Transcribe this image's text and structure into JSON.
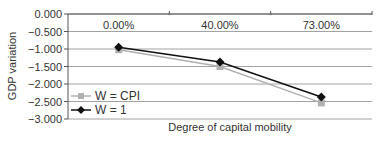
{
  "chart_data": {
    "type": "line",
    "title": "",
    "xlabel": "Degree of capital mobility",
    "ylabel": "GDP variation",
    "categories": [
      "0.00%",
      "40.00%",
      "73.00%"
    ],
    "series": [
      {
        "name": "W = CPI",
        "values": [
          -1.02,
          -1.5,
          -2.54
        ],
        "color": "#b0b0b0",
        "marker": "square"
      },
      {
        "name": "W = 1",
        "values": [
          -0.95,
          -1.37,
          -2.37
        ],
        "color": "#111111",
        "marker": "diamond"
      }
    ],
    "ylim": [
      -3.0,
      0.0
    ],
    "yticks": [
      "0.000",
      "-0.500",
      "-1.000",
      "-1.500",
      "-2.000",
      "-2.500",
      "-3.000"
    ],
    "grid": true,
    "legend_position": "lower-left inside",
    "category_labels_position": "top, below x-axis at y=0"
  }
}
